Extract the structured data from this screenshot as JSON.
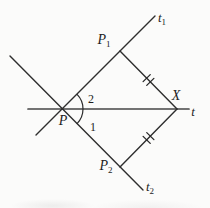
{
  "diagram": {
    "labels": {
      "p": "P",
      "angle_upper": "2",
      "angle_lower": "1",
      "p1": {
        "base": "P",
        "sub": "1"
      },
      "p2": {
        "base": "P",
        "sub": "2"
      },
      "x": "X",
      "t": "t",
      "t1": {
        "base": "t",
        "sub": "1"
      },
      "t2": {
        "base": "t",
        "sub": "2"
      }
    },
    "colors": {
      "line": "#2e2e2e",
      "horizontal_line": "#464646",
      "text": "#1d1d1d",
      "background": "#fbfbfa"
    }
  }
}
